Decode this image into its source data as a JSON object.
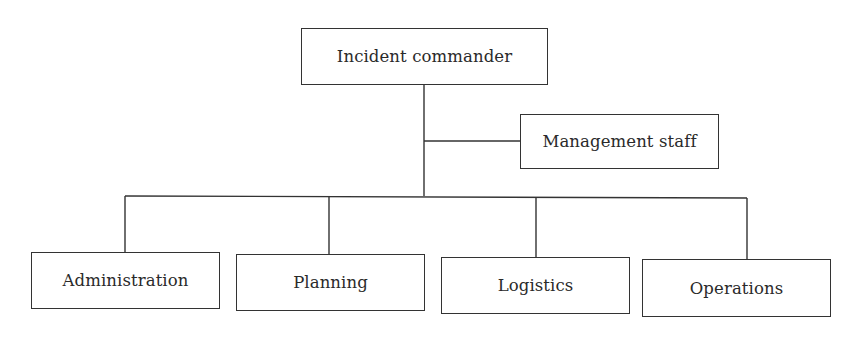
{
  "diagram": {
    "type": "org-chart",
    "root": {
      "id": "incident-commander",
      "label": "Incident commander"
    },
    "staff": {
      "id": "management-staff",
      "label": "Management staff",
      "attached_to": "incident-commander"
    },
    "sections": [
      {
        "id": "administration",
        "label": "Administration"
      },
      {
        "id": "planning",
        "label": "Planning"
      },
      {
        "id": "logistics",
        "label": "Logistics"
      },
      {
        "id": "operations",
        "label": "Operations"
      }
    ],
    "edges": [
      {
        "from": "incident-commander",
        "to": "management-staff"
      },
      {
        "from": "incident-commander",
        "to": "administration"
      },
      {
        "from": "incident-commander",
        "to": "planning"
      },
      {
        "from": "incident-commander",
        "to": "logistics"
      },
      {
        "from": "incident-commander",
        "to": "operations"
      }
    ],
    "colors": {
      "line": "#333333",
      "text": "#2a2a2a",
      "background": "#ffffff"
    }
  }
}
